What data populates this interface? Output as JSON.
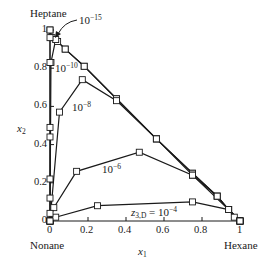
{
  "chart_data": {
    "type": "line",
    "title": "",
    "xlabel": "x1",
    "ylabel": "x2",
    "xlim": [
      0,
      1
    ],
    "ylim": [
      0,
      1
    ],
    "grid": false,
    "corner_labels": {
      "top_left": "Heptane",
      "bottom_left": "Nonane",
      "bottom_right": "Hexane"
    },
    "x_ticks": [
      "0",
      "0.2",
      "0.4",
      "0.6",
      "0.8",
      "1"
    ],
    "y_ticks": [
      "0",
      "0.2",
      "0.4",
      "0.6",
      "0.8",
      "1"
    ],
    "series": [
      {
        "name": "z3,D = 1e-15",
        "label": "10^-15",
        "points": [
          [
            0,
            1.0
          ],
          [
            0.01,
            0.96
          ],
          [
            0.04,
            0.94
          ],
          [
            0.08,
            0.9
          ],
          [
            0.18,
            0.81
          ],
          [
            0.35,
            0.64
          ],
          [
            0.56,
            0.43
          ],
          [
            0.75,
            0.25
          ],
          [
            0.88,
            0.13
          ],
          [
            0.94,
            0.06
          ],
          [
            0.97,
            0.02
          ],
          [
            1.0,
            0.0
          ]
        ]
      },
      {
        "name": "z3,D = 1e-10",
        "label": "10^-10",
        "points": [
          [
            0,
            0.0
          ],
          [
            0.005,
            0.83
          ],
          [
            0.03,
            0.95
          ],
          [
            0.08,
            0.9
          ],
          [
            0.18,
            0.81
          ],
          [
            0.35,
            0.64
          ],
          [
            0.56,
            0.43
          ],
          [
            0.75,
            0.25
          ],
          [
            0.88,
            0.13
          ],
          [
            0.94,
            0.06
          ],
          [
            1.0,
            0.0
          ]
        ]
      },
      {
        "name": "z3,D = 1e-8",
        "label": "10^-8",
        "points": [
          [
            0,
            0.0
          ],
          [
            0.05,
            0.57
          ],
          [
            0.17,
            0.74
          ],
          [
            0.35,
            0.63
          ],
          [
            0.56,
            0.43
          ],
          [
            0.75,
            0.24
          ],
          [
            0.88,
            0.13
          ],
          [
            0.94,
            0.06
          ],
          [
            1.0,
            0.0
          ]
        ]
      },
      {
        "name": "z3,D = 1e-6",
        "label": "10^-6",
        "points": [
          [
            0,
            0.0
          ],
          [
            0.02,
            0.07
          ],
          [
            0.14,
            0.26
          ],
          [
            0.47,
            0.36
          ],
          [
            0.75,
            0.24
          ],
          [
            0.94,
            0.06
          ],
          [
            1.0,
            0.0
          ]
        ]
      },
      {
        "name": "z3,D = 1e-4",
        "label": "z3,D = 10^-4",
        "points": [
          [
            0,
            0.0
          ],
          [
            0.03,
            0.02
          ],
          [
            0.25,
            0.08
          ],
          [
            0.75,
            0.1
          ],
          [
            0.94,
            0.06
          ],
          [
            1.0,
            0.0
          ]
        ]
      },
      {
        "name": "left edge",
        "label": "",
        "points": [
          [
            0,
            0.0
          ],
          [
            0,
            0.04
          ],
          [
            0,
            0.12
          ],
          [
            0,
            0.22
          ],
          [
            0,
            0.44
          ],
          [
            0,
            0.49
          ],
          [
            0,
            0.83
          ],
          [
            0,
            0.96
          ],
          [
            0,
            1.0
          ]
        ]
      }
    ],
    "annotations": [
      "10^-15 (arrow)",
      "10^-10",
      "10^-8",
      "10^-6",
      "z3,D = 10^-4"
    ]
  },
  "labels": {
    "heptane": "Heptane",
    "nonane": "Nonane",
    "hexane": "Hexane",
    "xlabel_main": "x",
    "xlabel_sub": "1",
    "ylabel_main": "x",
    "ylabel_sub": "2",
    "ann_15_base": "10",
    "ann_15_exp": "−15",
    "ann_10_base": "10",
    "ann_10_exp": "−10",
    "ann_8_base": "10",
    "ann_8_exp": "−8",
    "ann_6_base": "10",
    "ann_6_exp": "−6",
    "ann_4_pre": "z",
    "ann_4_sub": "3,D",
    "ann_4_eq": " = 10",
    "ann_4_exp": "−4"
  },
  "ticks": {
    "x": [
      "0",
      "0.2",
      "0.4",
      "0.6",
      "0.8",
      "1"
    ],
    "y": [
      "0",
      "0.2",
      "0.4",
      "0.6",
      "0.8",
      "1"
    ]
  },
  "colors": {
    "line": "#1a1a1a",
    "marker_fill": "#ffffff",
    "background": "#ffffff"
  }
}
